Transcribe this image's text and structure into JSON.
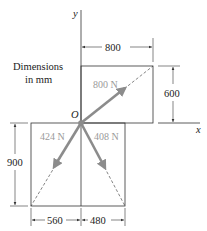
{
  "diagram": {
    "note_line1": "Dimensions",
    "note_line2": "in mm",
    "axis_x_label": "x",
    "axis_y_label": "y",
    "origin_label": "O",
    "forces": [
      {
        "label": "800 N",
        "dx": 800,
        "dy": 600
      },
      {
        "label": "424 N",
        "dx": -560,
        "dy": -900
      },
      {
        "label": "408 N",
        "dx": 480,
        "dy": -900
      }
    ],
    "dimensions": {
      "top_width": "800",
      "top_height": "600",
      "bottom_height": "900",
      "bottom_left_width": "560",
      "bottom_right_width": "480"
    },
    "colors": {
      "force_arrow": "#8c8c8c",
      "line": "#333333"
    }
  }
}
